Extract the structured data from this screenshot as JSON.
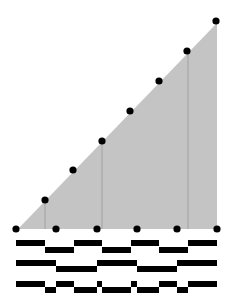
{
  "diagram": {
    "width": 230,
    "height": 307,
    "colors": {
      "ramp_fill": "#c4c4c4",
      "guide_line": "#9a9a9a",
      "dot": "#000000",
      "wave": "#000000",
      "background": "#ffffff"
    },
    "ramp": {
      "points": [
        [
          18,
          229
        ],
        [
          217,
          23
        ],
        [
          217,
          229
        ]
      ]
    },
    "guide_lines_x": [
      45,
      102,
      188
    ],
    "ramp_dots": [
      [
        45,
        200
      ],
      [
        73,
        170
      ],
      [
        102,
        141
      ],
      [
        130,
        111
      ],
      [
        159,
        81
      ],
      [
        187,
        51
      ],
      [
        216,
        21
      ]
    ],
    "baseline_dots": [
      [
        16,
        229
      ],
      [
        56,
        229
      ],
      [
        97,
        229
      ],
      [
        137,
        229
      ],
      [
        177,
        229
      ],
      [
        217,
        229
      ]
    ],
    "waveforms": [
      {
        "name": "signal-1",
        "high_y": 240,
        "low_y": 247,
        "thickness": 6,
        "segments": [
          [
            16,
            45,
            "high"
          ],
          [
            45,
            74,
            "low"
          ],
          [
            74,
            102,
            "high"
          ],
          [
            102,
            131,
            "low"
          ],
          [
            131,
            159,
            "high"
          ],
          [
            159,
            188,
            "low"
          ],
          [
            188,
            217,
            "high"
          ]
        ]
      },
      {
        "name": "signal-2",
        "high_y": 260,
        "low_y": 266,
        "thickness": 6,
        "segments": [
          [
            16,
            56,
            "high"
          ],
          [
            56,
            97,
            "low"
          ],
          [
            97,
            137,
            "high"
          ],
          [
            137,
            177,
            "low"
          ],
          [
            177,
            217,
            "high"
          ]
        ]
      },
      {
        "name": "signal-3",
        "high_y": 281,
        "low_y": 287,
        "thickness": 6,
        "segments": [
          [
            16,
            45,
            "high"
          ],
          [
            45,
            56,
            "low"
          ],
          [
            56,
            74,
            "high"
          ],
          [
            74,
            97,
            "low"
          ],
          [
            97,
            102,
            "high"
          ],
          [
            102,
            131,
            "low"
          ],
          [
            131,
            137,
            "high"
          ],
          [
            137,
            159,
            "low"
          ],
          [
            159,
            177,
            "high"
          ],
          [
            177,
            188,
            "low"
          ],
          [
            188,
            217,
            "high"
          ]
        ]
      }
    ],
    "dot_radius": 3.6
  }
}
